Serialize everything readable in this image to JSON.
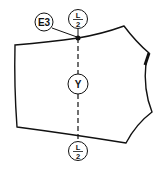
{
  "diagram": {
    "labels": {
      "e3": "E3",
      "y": "Y",
      "top_fraction": {
        "num": "L",
        "den": "2"
      },
      "bottom_fraction": {
        "num": "L",
        "den": "2"
      }
    },
    "colors": {
      "stroke": "#111111",
      "background": "#ffffff"
    }
  }
}
